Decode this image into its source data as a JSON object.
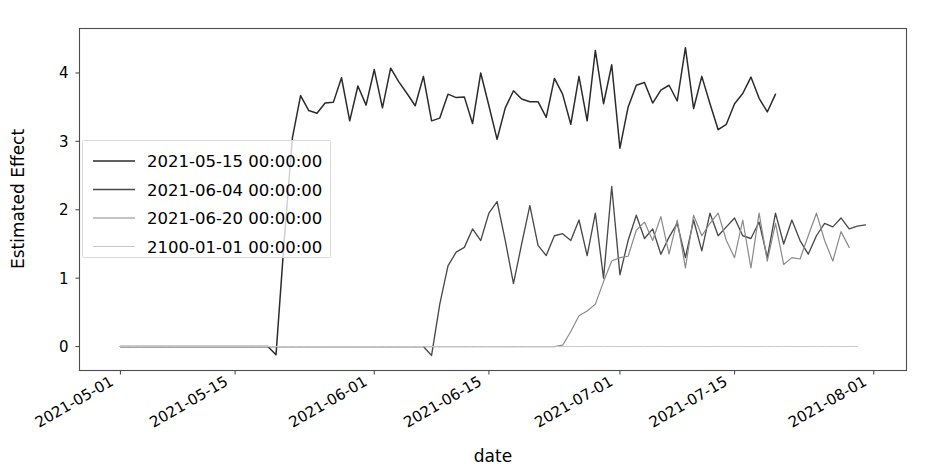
{
  "chart_data": {
    "type": "line",
    "title": "",
    "xlabel": "date",
    "ylabel": "Estimated Effect",
    "xlim": [
      "2021-04-26",
      "2021-08-05"
    ],
    "ylim": [
      -0.35,
      4.65
    ],
    "grid": false,
    "legend_position": "center-left-inside",
    "yticks": [
      0,
      1,
      2,
      3,
      4
    ],
    "ytick_labels": [
      "0",
      "1",
      "2",
      "3",
      "4"
    ],
    "xticks": [
      "2021-05-01",
      "2021-05-15",
      "2021-06-01",
      "2021-06-15",
      "2021-07-01",
      "2021-07-15",
      "2021-08-01"
    ],
    "xtick_labels": [
      "2021-05-01",
      "2021-05-15",
      "2021-06-01",
      "2021-06-15",
      "2021-07-01",
      "2021-07-15",
      "2021-08-01"
    ],
    "x_start": "2021-04-26",
    "x_day_count": 101,
    "series": [
      {
        "name": "2021-05-15 00:00:00",
        "color": "#2b2b2b",
        "linewidth": 1.5,
        "start_day_index": 5,
        "values": [
          0,
          0,
          0,
          0,
          0,
          0,
          0,
          0,
          0,
          0,
          0,
          0,
          0,
          0,
          0,
          0,
          0,
          0,
          0,
          -0.12,
          1.55,
          3.05,
          3.67,
          3.45,
          3.41,
          3.56,
          3.57,
          3.93,
          3.3,
          3.81,
          3.53,
          4.05,
          3.49,
          4.07,
          3.87,
          3.7,
          3.52,
          3.95,
          3.3,
          3.34,
          3.69,
          3.64,
          3.65,
          3.26,
          4.0,
          3.52,
          3.03,
          3.49,
          3.74,
          3.62,
          3.58,
          3.58,
          3.35,
          3.92,
          3.69,
          3.25,
          3.95,
          3.3,
          4.33,
          3.55,
          4.12,
          2.9,
          3.5,
          3.82,
          3.86,
          3.56,
          3.75,
          3.82,
          3.59,
          4.37,
          3.48,
          3.95,
          3.55,
          3.17,
          3.25,
          3.55,
          3.7,
          3.94,
          3.63,
          3.43,
          3.69
        ]
      },
      {
        "name": "2021-06-04 00:00:00",
        "color": "#4a4a4a",
        "linewidth": 1.35,
        "start_day_index": 5,
        "values": [
          0,
          0,
          0,
          0,
          0,
          0,
          0,
          0,
          0,
          0,
          0,
          0,
          0,
          0,
          0,
          0,
          0,
          0,
          0,
          0,
          0,
          0,
          0,
          0,
          0,
          0,
          0,
          0,
          0,
          0,
          0,
          0,
          0,
          0,
          0,
          0,
          0,
          0,
          -0.13,
          0.62,
          1.18,
          1.38,
          1.45,
          1.72,
          1.55,
          1.95,
          2.12,
          1.55,
          0.92,
          1.5,
          2.06,
          1.48,
          1.33,
          1.62,
          1.65,
          1.55,
          1.85,
          1.33,
          1.95,
          1.0,
          2.34,
          1.05,
          1.55,
          1.92,
          1.58,
          1.72,
          1.35,
          1.6,
          1.8,
          1.3,
          1.85,
          1.4,
          1.95,
          1.62,
          1.75,
          1.88,
          1.62,
          1.58,
          1.82,
          1.3,
          1.95,
          1.5,
          1.85,
          1.55,
          1.35,
          1.62,
          1.8,
          1.75,
          1.88,
          1.72,
          1.76,
          1.78
        ]
      },
      {
        "name": "2021-06-20 00:00:00",
        "color": "#8a8a8a",
        "linewidth": 1.2,
        "start_day_index": 5,
        "values": [
          0,
          0,
          0,
          0,
          0,
          0,
          0,
          0,
          0,
          0,
          0,
          0,
          0,
          0,
          0,
          0,
          0,
          0,
          0,
          0,
          0,
          0,
          0,
          0,
          0,
          0,
          0,
          0,
          0,
          0,
          0,
          0,
          0,
          0,
          0,
          0,
          0,
          0,
          0,
          0,
          0,
          0,
          0,
          0,
          0,
          0,
          0,
          0,
          0,
          0,
          0,
          0,
          0,
          0,
          0.02,
          0.22,
          0.45,
          0.52,
          0.62,
          0.95,
          1.25,
          1.3,
          1.32,
          1.7,
          1.82,
          1.55,
          1.9,
          1.35,
          1.85,
          1.15,
          1.92,
          1.62,
          1.8,
          1.95,
          1.55,
          1.3,
          1.85,
          1.15,
          1.95,
          1.25,
          1.8,
          1.2,
          1.3,
          1.28,
          1.62,
          1.95,
          1.55,
          1.25,
          1.68,
          1.45
        ]
      },
      {
        "name": "2100-01-01 00:00:00",
        "color": "#c8c8c8",
        "linewidth": 1.0,
        "start_day_index": 5,
        "values": [
          0,
          0,
          0,
          0,
          0,
          0,
          0,
          0,
          0,
          0,
          0,
          0,
          0,
          0,
          0,
          0,
          0,
          0,
          0,
          0,
          0,
          0,
          0,
          0,
          0,
          0,
          0,
          0,
          0,
          0,
          0,
          0,
          0,
          0,
          0,
          0,
          0,
          0,
          0,
          0,
          0,
          0,
          0,
          0,
          0,
          0,
          0,
          0,
          0,
          0,
          0,
          0,
          0,
          0,
          0,
          0,
          0,
          0,
          0,
          0,
          0,
          0,
          0,
          0,
          0,
          0,
          0,
          0,
          0,
          0,
          0,
          0,
          0,
          0,
          0,
          0,
          0,
          0,
          0,
          0,
          0,
          0,
          0,
          0,
          0,
          0,
          0,
          0,
          0,
          0,
          0
        ]
      }
    ]
  },
  "legend": {
    "entries": [
      {
        "label": "2021-05-15 00:00:00"
      },
      {
        "label": "2021-06-04 00:00:00"
      },
      {
        "label": "2021-06-20 00:00:00"
      },
      {
        "label": "2100-01-01 00:00:00"
      }
    ]
  }
}
